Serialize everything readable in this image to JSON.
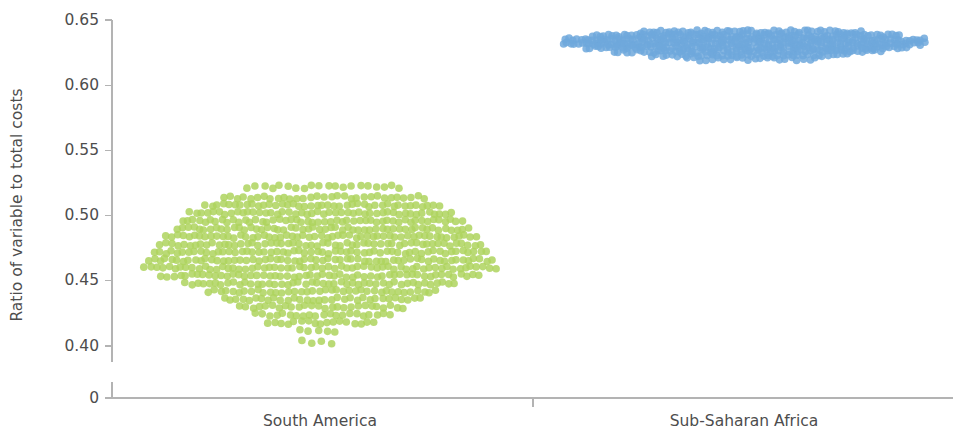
{
  "chart_data": {
    "type": "scatter",
    "plot_style": "beeswarm",
    "title": "",
    "subtitle": "",
    "xlabel": "",
    "ylabel": "Ratio of variable to total costs",
    "categories": [
      "South America",
      "Sub-Saharan Africa"
    ],
    "y_tick_labels": [
      "0",
      "0.40",
      "0.45",
      "0.50",
      "0.55",
      "0.60",
      "0.65"
    ],
    "y_tick_values": [
      0,
      0.4,
      0.45,
      0.5,
      0.55,
      0.6,
      0.65
    ],
    "ylim": [
      0.37,
      0.655
    ],
    "axis_broken": true,
    "axis_break_note": "zero baseline drawn below 0.40 with break",
    "grid": false,
    "legend": "none",
    "annotations": [],
    "series": [
      {
        "name": "South America",
        "color": "#aed35e",
        "center_x": 320,
        "point_count": 430,
        "y_min": 0.415,
        "y_max": 0.522,
        "y_median": 0.462,
        "rows": [
          {
            "value": 0.522,
            "count": 20,
            "x_start": 248,
            "x_end": 400
          },
          {
            "value": 0.514,
            "count": 31,
            "x_start": 224,
            "x_end": 424
          },
          {
            "value": 0.508,
            "count": 41,
            "x_start": 206,
            "x_end": 440
          },
          {
            "value": 0.502,
            "count": 46,
            "x_start": 190,
            "x_end": 452
          },
          {
            "value": 0.496,
            "count": 50,
            "x_start": 182,
            "x_end": 462
          },
          {
            "value": 0.49,
            "count": 52,
            "x_start": 176,
            "x_end": 468
          },
          {
            "value": 0.484,
            "count": 55,
            "x_start": 166,
            "x_end": 476
          },
          {
            "value": 0.478,
            "count": 56,
            "x_start": 160,
            "x_end": 480
          },
          {
            "value": 0.472,
            "count": 58,
            "x_start": 154,
            "x_end": 486
          },
          {
            "value": 0.466,
            "count": 60,
            "x_start": 148,
            "x_end": 492
          },
          {
            "value": 0.46,
            "count": 60,
            "x_start": 145,
            "x_end": 495
          },
          {
            "value": 0.454,
            "count": 54,
            "x_start": 162,
            "x_end": 478
          },
          {
            "value": 0.448,
            "count": 46,
            "x_start": 186,
            "x_end": 454
          },
          {
            "value": 0.442,
            "count": 38,
            "x_start": 208,
            "x_end": 436
          },
          {
            "value": 0.436,
            "count": 32,
            "x_start": 224,
            "x_end": 420
          },
          {
            "value": 0.43,
            "count": 26,
            "x_start": 240,
            "x_end": 404
          },
          {
            "value": 0.424,
            "count": 21,
            "x_start": 256,
            "x_end": 390
          },
          {
            "value": 0.418,
            "count": 17,
            "x_start": 268,
            "x_end": 374
          },
          {
            "value": 0.412,
            "count": 5,
            "x_start": 300,
            "x_end": 336
          },
          {
            "value": 0.403,
            "count": 4,
            "x_start": 302,
            "x_end": 332
          }
        ]
      },
      {
        "name": "Sub-Saharan Africa",
        "color": "#6fa8dc",
        "center_x": 744,
        "point_count": 470,
        "y_min": 0.619,
        "y_max": 0.642,
        "y_median": 0.632,
        "rows": [
          {
            "value": 0.641,
            "count": 52,
            "x_start": 640,
            "x_end": 860
          },
          {
            "value": 0.638,
            "count": 78,
            "x_start": 592,
            "x_end": 900
          },
          {
            "value": 0.635,
            "count": 96,
            "x_start": 566,
            "x_end": 924
          },
          {
            "value": 0.632,
            "count": 96,
            "x_start": 563,
            "x_end": 925
          },
          {
            "value": 0.629,
            "count": 80,
            "x_start": 586,
            "x_end": 906
          },
          {
            "value": 0.626,
            "count": 62,
            "x_start": 614,
            "x_end": 880
          },
          {
            "value": 0.623,
            "count": 40,
            "x_start": 652,
            "x_end": 848
          },
          {
            "value": 0.62,
            "count": 22,
            "x_start": 688,
            "x_end": 816
          }
        ]
      }
    ]
  },
  "axis": {
    "y_axis_title": "Ratio of variable to total costs",
    "category_separator_present": true
  }
}
